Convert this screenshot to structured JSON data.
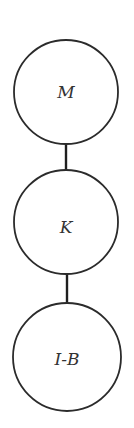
{
  "diagram": {
    "type": "vertical-chain",
    "nodes": [
      {
        "id": "node-1",
        "label": "M",
        "cx": 66,
        "cy": 92,
        "r": 52
      },
      {
        "id": "node-2",
        "label": "K",
        "cx": 66,
        "cy": 222,
        "r": 52
      },
      {
        "id": "node-3",
        "label": "I-B",
        "cx": 67,
        "cy": 357,
        "r": 54
      }
    ],
    "edges": [
      {
        "from": "M",
        "to": "K",
        "x": 66,
        "y1": 144,
        "y2": 170
      },
      {
        "from": "K",
        "to": "I-B",
        "x": 67,
        "y1": 274,
        "y2": 303
      }
    ],
    "colors": {
      "stroke": "#2b2b2b",
      "label": "#333333",
      "background": "#ffffff"
    }
  }
}
